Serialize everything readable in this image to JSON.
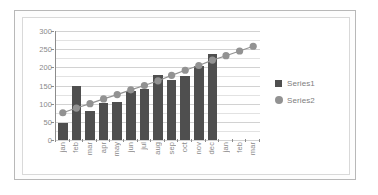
{
  "chart_data": {
    "type": "bar",
    "title": "",
    "subtitle": "",
    "xlabel": "",
    "ylabel": "",
    "ylim": [
      0,
      300
    ],
    "ytick_labels": [
      "0",
      "50",
      "100",
      "150",
      "200",
      "250",
      "300"
    ],
    "ytick_values": [
      0,
      50,
      100,
      150,
      200,
      250,
      300
    ],
    "grid": true,
    "grid_minor_step": 25,
    "legend_position": "right",
    "categories": [
      "jan",
      "feb",
      "mar",
      "apr",
      "may",
      "jun",
      "jul",
      "aug",
      "sep",
      "oct",
      "nov",
      "dec",
      "jan",
      "feb",
      "mar"
    ],
    "series": [
      {
        "name": "Series1",
        "type": "bar",
        "color": "#4f4f4f",
        "values": [
          48,
          149,
          80,
          103,
          105,
          135,
          140,
          178,
          165,
          175,
          205,
          238,
          null,
          null,
          null
        ]
      },
      {
        "name": "Series2",
        "type": "line",
        "color": "#929292",
        "marker": "circle",
        "values": [
          75,
          88,
          100,
          113,
          125,
          138,
          150,
          163,
          178,
          192,
          205,
          220,
          232,
          245,
          258
        ]
      }
    ]
  },
  "legend": {
    "items": [
      {
        "label": "Series1",
        "marker": "square",
        "color": "#4f4f4f"
      },
      {
        "label": "Series2",
        "marker": "circle",
        "color": "#929292"
      }
    ]
  },
  "colors": {
    "bar": "#4f4f4f",
    "line": "#929292",
    "axis": "#8c8c8c",
    "gridline": "#e2e2e2",
    "tick_text": "#8a8a8a",
    "frame_outer": "#b8b8b8",
    "frame_inner": "#d9d9d9",
    "plot_background": "#ffffff"
  }
}
